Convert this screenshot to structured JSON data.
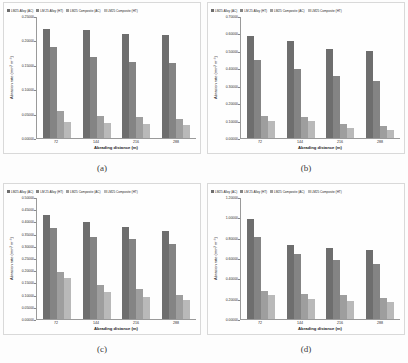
{
  "figure": {
    "panel_count": 4,
    "series_names": [
      "LM25 Alloy (AC)",
      "LM 25 Alloy (HT)",
      "LM25 Composite (AC)",
      "LM25 Composite (HT)"
    ],
    "series_colors": [
      "#6e6e6e",
      "#848484",
      "#9e9e9e",
      "#b9b9b9"
    ]
  },
  "chart_data": [
    {
      "type": "bar",
      "panel": "a",
      "caption": "(a)",
      "title": "",
      "xlabel": "Abrading distance (m)",
      "ylabel": "Abrasion rate (mm³ m⁻¹)",
      "categories": [
        "72",
        "144",
        "216",
        "288"
      ],
      "ylim": [
        0.0,
        0.25
      ],
      "yticks": [
        "0.00000",
        "0.05000",
        "0.10000",
        "0.15000",
        "0.20000",
        "0.25000"
      ],
      "ytick_values": [
        0.0,
        0.05,
        0.1,
        0.15,
        0.2,
        0.25
      ],
      "grid": false,
      "legend_position": "top",
      "series": [
        {
          "name": "LM25 Alloy (AC)",
          "values": [
            0.225,
            0.224,
            0.215,
            0.213
          ]
        },
        {
          "name": "LM 25 Alloy (HT)",
          "values": [
            0.188,
            0.167,
            0.158,
            0.156
          ]
        },
        {
          "name": "LM25 Composite (AC)",
          "values": [
            0.055,
            0.046,
            0.044,
            0.04
          ]
        },
        {
          "name": "LM25 Composite (HT)",
          "values": [
            0.033,
            0.031,
            0.028,
            0.026
          ]
        }
      ]
    },
    {
      "type": "bar",
      "panel": "b",
      "caption": "(b)",
      "title": "",
      "xlabel": "Abrading distance (m)",
      "ylabel": "Abrasion rate (mm³ m⁻¹)",
      "categories": [
        "72",
        "144",
        "216",
        "288"
      ],
      "ylim": [
        0.0,
        0.7
      ],
      "yticks": [
        "0.00000",
        "0.10000",
        "0.20000",
        "0.30000",
        "0.40000",
        "0.50000",
        "0.60000",
        "0.70000"
      ],
      "ytick_values": [
        0.0,
        0.1,
        0.2,
        0.3,
        0.4,
        0.5,
        0.6,
        0.7
      ],
      "grid": false,
      "legend_position": "top",
      "series": [
        {
          "name": "LM25 Alloy (AC)",
          "values": [
            0.59,
            0.56,
            0.515,
            0.505
          ]
        },
        {
          "name": "LM 25 Alloy (HT)",
          "values": [
            0.45,
            0.4,
            0.36,
            0.33
          ]
        },
        {
          "name": "LM25 Composite (AC)",
          "values": [
            0.13,
            0.12,
            0.08,
            0.07
          ]
        },
        {
          "name": "LM25 Composite (HT)",
          "values": [
            0.1,
            0.1,
            0.06,
            0.045
          ]
        }
      ]
    },
    {
      "type": "bar",
      "panel": "c",
      "caption": "(c)",
      "title": "",
      "xlabel": "Abrading distance (m)",
      "ylabel": "Abrasion rate (mm³ m⁻¹)",
      "categories": [
        "72",
        "144",
        "216",
        "288"
      ],
      "ylim": [
        0.0,
        0.5
      ],
      "yticks": [
        "0.00000",
        "0.05000",
        "0.10000",
        "0.15000",
        "0.20000",
        "0.25000",
        "0.30000",
        "0.35000",
        "0.40000",
        "0.45000",
        "0.50000"
      ],
      "ytick_values": [
        0.0,
        0.05,
        0.1,
        0.15,
        0.2,
        0.25,
        0.3,
        0.35,
        0.4,
        0.45,
        0.5
      ],
      "grid": false,
      "legend_position": "top",
      "series": [
        {
          "name": "LM25 Alloy (AC)",
          "values": [
            0.43,
            0.4,
            0.38,
            0.365
          ]
        },
        {
          "name": "LM 25 Alloy (HT)",
          "values": [
            0.375,
            0.34,
            0.33,
            0.31
          ]
        },
        {
          "name": "LM25 Composite (AC)",
          "values": [
            0.195,
            0.14,
            0.125,
            0.1
          ]
        },
        {
          "name": "LM25 Composite (HT)",
          "values": [
            0.17,
            0.11,
            0.09,
            0.08
          ]
        }
      ]
    },
    {
      "type": "bar",
      "panel": "d",
      "caption": "(d)",
      "title": "",
      "xlabel": "Abrading distance (m)",
      "ylabel": "Abrasion rate (mm³ m⁻¹)",
      "categories": [
        "72",
        "144",
        "216",
        "288"
      ],
      "ylim": [
        0.0,
        1.2
      ],
      "yticks": [
        "0.00000",
        "0.20000",
        "0.40000",
        "0.60000",
        "0.80000",
        "1.00000",
        "1.20000"
      ],
      "ytick_values": [
        0.0,
        0.2,
        0.4,
        0.6,
        0.8,
        1.0,
        1.2
      ],
      "grid": false,
      "legend_position": "top",
      "series": [
        {
          "name": "LM25 Alloy (AC)",
          "values": [
            0.99,
            0.73,
            0.7,
            0.68
          ]
        },
        {
          "name": "LM 25 Alloy (HT)",
          "values": [
            0.81,
            0.64,
            0.59,
            0.55
          ]
        },
        {
          "name": "LM25 Composite (AC)",
          "values": [
            0.28,
            0.25,
            0.24,
            0.21
          ]
        },
        {
          "name": "LM25 Composite (HT)",
          "values": [
            0.24,
            0.195,
            0.175,
            0.17
          ]
        }
      ]
    }
  ]
}
